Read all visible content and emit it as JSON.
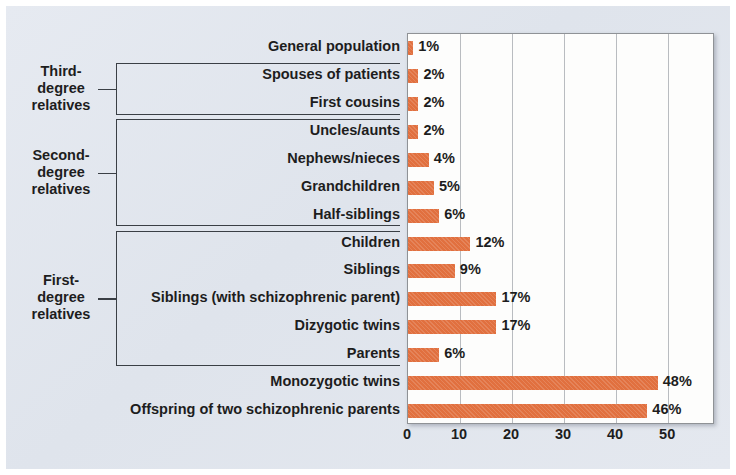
{
  "chart_data": {
    "type": "bar",
    "orientation": "horizontal",
    "title": "",
    "xlabel": "Lifetime risk (in percentage)",
    "ylabel": "",
    "xlim": [
      0,
      59
    ],
    "xticks": [
      0,
      10,
      20,
      30,
      40,
      50
    ],
    "xtick_labels": [
      "0",
      "10",
      "20",
      "30",
      "40",
      "50"
    ],
    "grid": "vertical",
    "legend": "none",
    "bar_color": "#e1703f",
    "categories": [
      "General population",
      "Spouses of patients",
      "First cousins",
      "Uncles/aunts",
      "Nephews/nieces",
      "Grandchildren",
      "Half-siblings",
      "Children",
      "Siblings",
      "Siblings (with schizophrenic parent)",
      "Dizygotic twins",
      "Parents",
      "Monozygotic twins",
      "Offspring of two schizophrenic parents"
    ],
    "values": [
      1,
      2,
      2,
      2,
      4,
      5,
      6,
      12,
      9,
      17,
      17,
      6,
      48,
      46
    ],
    "value_labels": [
      "1%",
      "2%",
      "2%",
      "2%",
      "4%",
      "5%",
      "6%",
      "12%",
      "9%",
      "17%",
      "17%",
      "6%",
      "48%",
      "46%"
    ],
    "groups": [
      {
        "label": "Third-\ndegree\nrelatives",
        "start_index": 1,
        "end_index": 2
      },
      {
        "label": "Second-\ndegree\nrelatives",
        "start_index": 3,
        "end_index": 6
      },
      {
        "label": "First-\ndegree\nrelatives",
        "start_index": 7,
        "end_index": 11
      }
    ]
  },
  "axis": {
    "title": "Lifetime risk (in percentage)"
  },
  "colors": {
    "bar": "#e1703f",
    "panel_background": "#e2e7ee",
    "plot_background": "#fdfdfc",
    "gridline": "#b9bcc0",
    "text": "#1d1d1d",
    "bracket": "#3a3f45"
  }
}
